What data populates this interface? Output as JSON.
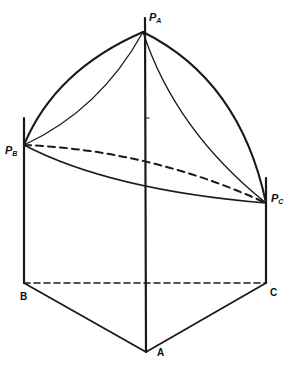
{
  "diagram": {
    "stroke_color": "#1a1a1a",
    "background": "#ffffff",
    "points": {
      "PA": {
        "label": "P",
        "sub": "A",
        "x": 143,
        "y": 32
      },
      "PB": {
        "label": "P",
        "sub": "B",
        "x": 24,
        "y": 145
      },
      "PC": {
        "label": "P",
        "sub": "C",
        "x": 266,
        "y": 203
      },
      "A": {
        "label": "A",
        "x": 146,
        "y": 352
      },
      "B": {
        "label": "B",
        "x": 24,
        "y": 283
      },
      "C": {
        "label": "C",
        "x": 266,
        "y": 283
      }
    },
    "labels": {
      "pa_main": "P",
      "pa_sub": "A",
      "pb_main": "P",
      "pb_sub": "B",
      "pc_main": "P",
      "pc_sub": "C",
      "a": "A",
      "b": "B",
      "c": "C"
    }
  }
}
